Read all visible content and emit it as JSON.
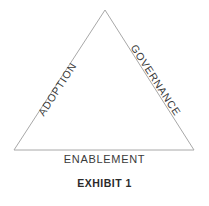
{
  "figure": {
    "caption": "EXHIBIT 1",
    "shape": "triangle",
    "stroke_color": "#a8a8a8",
    "text_color": "#3a3a3a",
    "caption_color": "#2b2b2b",
    "background_color": "#ffffff",
    "vertices": {
      "apex": [
        105,
        10
      ],
      "bottom_left": [
        14,
        150
      ],
      "bottom_right": [
        194,
        150
      ]
    },
    "edges": [
      {
        "id": "left",
        "label": "ADOPTION",
        "rotation_deg": -57
      },
      {
        "id": "right",
        "label": "GOVERNANCE",
        "rotation_deg": 57
      },
      {
        "id": "base",
        "label": "ENABLEMENT",
        "rotation_deg": 0
      }
    ]
  }
}
